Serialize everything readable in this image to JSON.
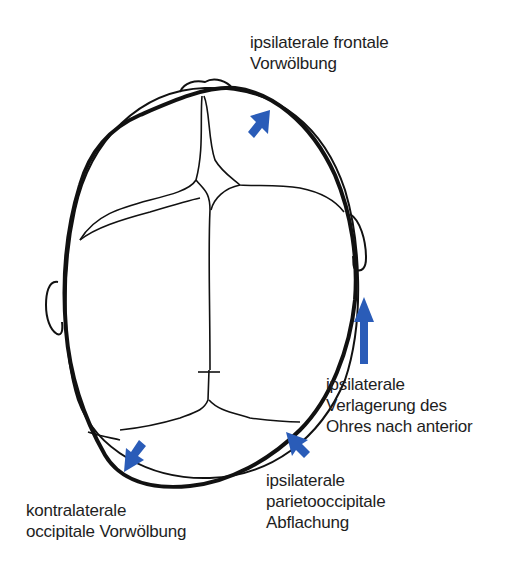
{
  "diagram": {
    "arrow_color": "#2a5cb8",
    "outline_color": "#111111",
    "annotations": [
      {
        "id": "frontal",
        "lines": [
          "ipsilaterale frontale",
          "Vorwölbung"
        ]
      },
      {
        "id": "ear",
        "lines": [
          "ipsilaterale",
          "Verlagerung des",
          "Ohres nach anterior"
        ]
      },
      {
        "id": "parieto",
        "lines": [
          "ipsilaterale",
          "parietooccipitale",
          "Abflachung"
        ]
      },
      {
        "id": "occipital",
        "lines": [
          "kontralaterale",
          "occipitale Vorwölbung"
        ]
      }
    ]
  }
}
